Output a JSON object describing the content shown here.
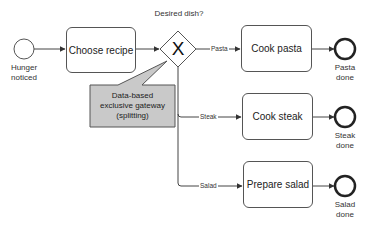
{
  "diagram": {
    "type": "BPMN process",
    "start_event": {
      "label_line1": "Hunger",
      "label_line2": "noticed"
    },
    "tasks": {
      "choose_recipe": "Choose recipe",
      "cook_pasta": "Cook pasta",
      "cook_steak": "Cook steak",
      "prepare_salad": "Prepare salad"
    },
    "gateway": {
      "question": "Desired dish?",
      "symbol": "X"
    },
    "flows": {
      "pasta": "Pasta",
      "steak": "Steak",
      "salad": "Salad"
    },
    "end_events": {
      "pasta": {
        "label_line1": "Pasta",
        "label_line2": "done"
      },
      "steak": {
        "label_line1": "Steak",
        "label_line2": "done"
      },
      "salad": {
        "label_line1": "Salad",
        "label_line2": "done"
      }
    },
    "annotation": {
      "line1": "Data-based",
      "line2": "exclusive gateway",
      "line3": "(splitting)"
    },
    "colors": {
      "stroke": "#555555",
      "annotation_fill": "#c9c9c9",
      "background": "#ffffff"
    }
  }
}
